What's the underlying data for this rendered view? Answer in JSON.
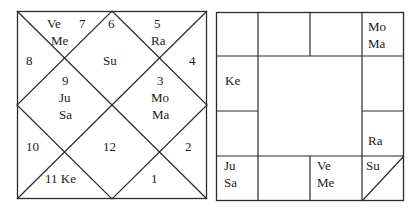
{
  "north_chart": {
    "houses": [
      {
        "num": "1",
        "planets": ""
      },
      {
        "num": "2",
        "planets": ""
      },
      {
        "num": "3",
        "planets": "Mo\nMa"
      },
      {
        "num": "4",
        "planets": ""
      },
      {
        "num": "5",
        "planets": "Ra"
      },
      {
        "num": "6",
        "planets": ""
      },
      {
        "num": "7",
        "planets": "Ve\nMe"
      },
      {
        "num": "8",
        "planets": ""
      },
      {
        "num": "9",
        "planets": "Ju\nSa"
      },
      {
        "num": "10",
        "planets": ""
      },
      {
        "num": "11",
        "planets": "Ke"
      },
      {
        "num": "12",
        "planets": ""
      }
    ],
    "center_top_planet": "Su",
    "labels": {
      "ve": "Ve",
      "seven": "7",
      "me": "Me",
      "six": "6",
      "five": "5",
      "ra": "Ra",
      "eight": "8",
      "su": "Su",
      "four": "4",
      "nine": "9",
      "ju": "Ju",
      "sa": "Sa",
      "three": "3",
      "mo": "Mo",
      "ma": "Ma",
      "ten": "10",
      "twelve": "12",
      "two": "2",
      "eleven_ke": "11 Ke",
      "one": "1"
    }
  },
  "south_chart": {
    "cells": {
      "r0c0": "",
      "r0c1": "",
      "r0c2": "",
      "r0c3": "Mo\nMa",
      "r1c0": "Ke",
      "r1c3": "",
      "r2c0": "",
      "r2c3": "Ra",
      "r3c0": "Ju\nSa",
      "r3c1": "",
      "r3c2": "Ve\nMe",
      "r3c3": "Su"
    }
  },
  "colors": {
    "line": "#2a2a2a",
    "text": "#1a1a1a",
    "background": "#ffffff"
  }
}
